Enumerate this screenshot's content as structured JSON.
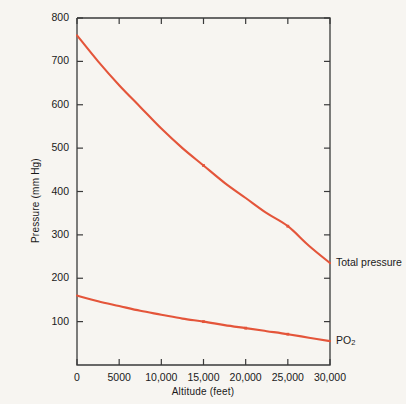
{
  "chart_data": {
    "type": "line",
    "title": "",
    "xlabel": "Altitude (feet)",
    "ylabel": "Pressure (mm Hg)",
    "xlim": [
      0,
      30000
    ],
    "ylim": [
      0,
      800
    ],
    "grid": false,
    "legend_position": "right-of-axes",
    "xticks": [
      0,
      5000,
      10000,
      15000,
      20000,
      25000,
      30000
    ],
    "xtick_labels": [
      "0",
      "5000",
      "10,000",
      "15,000",
      "20,000",
      "25,000",
      "30,000"
    ],
    "yticks": [
      100,
      200,
      300,
      400,
      500,
      600,
      700,
      800
    ],
    "ytick_labels": [
      "100",
      "200",
      "300",
      "400",
      "500",
      "600",
      "700",
      "800"
    ],
    "series": [
      {
        "name": "Total pressure",
        "label_text": "Total pressure",
        "color": "#e4553a",
        "x": [
          0,
          2500,
          5000,
          7500,
          10000,
          12500,
          15000,
          17500,
          20000,
          22500,
          25000,
          27500,
          30000
        ],
        "values": [
          760,
          700,
          645,
          595,
          545,
          500,
          460,
          420,
          385,
          350,
          320,
          275,
          235
        ]
      },
      {
        "name": "PO2",
        "label_text": "PO",
        "label_subscript": "2",
        "color": "#e4553a",
        "x": [
          0,
          2500,
          5000,
          7500,
          10000,
          12500,
          15000,
          17500,
          20000,
          22500,
          25000,
          27500,
          30000
        ],
        "values": [
          160,
          147,
          136,
          125,
          116,
          107,
          100,
          92,
          85,
          78,
          71,
          63,
          55
        ]
      }
    ],
    "markers": [
      {
        "series": "Total pressure",
        "x": 15000,
        "y": 460
      },
      {
        "series": "Total pressure",
        "x": 25000,
        "y": 320
      },
      {
        "series": "PO2",
        "x": 15000,
        "y": 100
      },
      {
        "series": "PO2",
        "x": 20000,
        "y": 85
      },
      {
        "series": "PO2",
        "x": 25000,
        "y": 71
      }
    ]
  },
  "colors": {
    "background": "#f7f5f1",
    "axis": "#3a3a3a",
    "text": "#1a1a1a",
    "series": "#e4553a"
  }
}
